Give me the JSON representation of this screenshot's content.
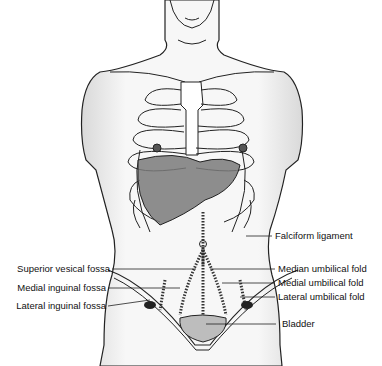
{
  "diagram": {
    "labels_left": [
      {
        "id": "superior-vesical-fossa",
        "text": "Superior vesical fossa"
      },
      {
        "id": "medial-inguinal-fossa",
        "text": "Medial inguinal fossa"
      },
      {
        "id": "lateral-inguinal-fossa",
        "text": "Lateral inguinal fossa"
      }
    ],
    "labels_right": [
      {
        "id": "falciform-ligament",
        "text": "Falciform ligament"
      },
      {
        "id": "median-umbilical-fold",
        "text": "Median umbilical fold"
      },
      {
        "id": "medial-umbilical-fold",
        "text": "Medial umbilical fold"
      },
      {
        "id": "lateral-umbilical-fold",
        "text": "Lateral umbilical fold"
      },
      {
        "id": "bladder",
        "text": "Bladder"
      }
    ],
    "colors": {
      "line": "#222222",
      "liver": "#7a7a7a",
      "skin_shade": "#e6e6e6",
      "bladder": "#bdbdbd"
    }
  }
}
